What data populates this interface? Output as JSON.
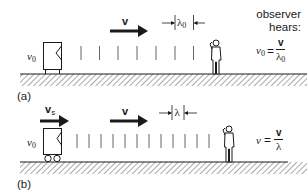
{
  "diagram": {
    "colors": {
      "ink": "#1a1a1a",
      "hatch": "#555555",
      "wave": "#666666",
      "background": "#ffffff"
    }
  },
  "panel_a": {
    "label": "(a)",
    "source_label_symbol": "ν",
    "source_label_sub": "0",
    "wave_velocity_label": "v",
    "wavelength_symbol": "λ",
    "wavelength_sub": "0",
    "observer_text_line1": "observer",
    "observer_text_line2": "hears:",
    "formula_lhs_symbol": "ν",
    "formula_lhs_sub": "0",
    "formula_eq": "=",
    "formula_num": "v",
    "formula_den_symbol": "λ",
    "formula_den_sub": "0",
    "wave_count": 8,
    "source_moving": false
  },
  "panel_b": {
    "label": "(b)",
    "source_label_symbol": "ν",
    "source_label_sub": "0",
    "source_velocity_label": "v",
    "source_velocity_sub": "s",
    "wave_velocity_label": "v",
    "wavelength_symbol": "λ",
    "formula_lhs_symbol": "ν",
    "formula_eq": "=",
    "formula_num": "v",
    "formula_den_symbol": "λ",
    "wave_count": 12,
    "source_moving": true
  }
}
